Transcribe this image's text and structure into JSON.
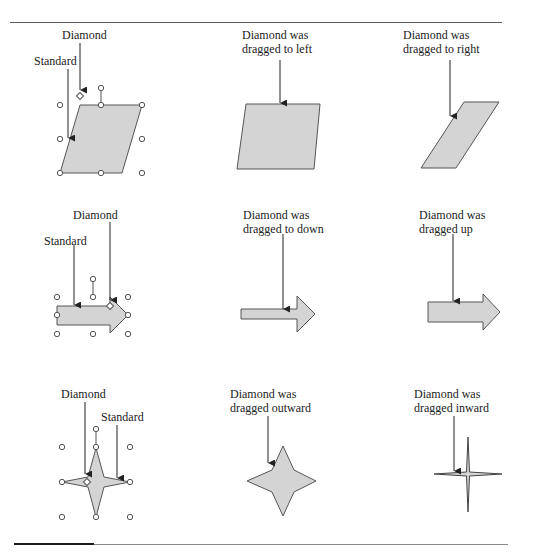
{
  "figure": {
    "panels": [
      {
        "id": "parallelogram-standard",
        "labels": {
          "diamond": "Diamond",
          "standard": "Standard"
        }
      },
      {
        "id": "parallelogram-left",
        "caption": "Diamond was\ndragged to left"
      },
      {
        "id": "parallelogram-right",
        "caption": "Diamond was\ndragged to right"
      },
      {
        "id": "arrow-standard",
        "labels": {
          "diamond": "Diamond",
          "standard": "Standard"
        }
      },
      {
        "id": "arrow-down",
        "caption": "Diamond was\ndragged to down"
      },
      {
        "id": "arrow-up",
        "caption": "Diamond was\ndragged up"
      },
      {
        "id": "star-standard",
        "labels": {
          "diamond": "Diamond",
          "standard": "Standard"
        }
      },
      {
        "id": "star-outward",
        "caption": "Diamond was\ndragged outward"
      },
      {
        "id": "star-inward",
        "caption": "Diamond was\ndragged inward"
      }
    ],
    "colors": {
      "shape_fill": "#d4d4d4",
      "shape_stroke": "#555555",
      "line": "#222222",
      "handle_stroke": "#555555"
    }
  }
}
